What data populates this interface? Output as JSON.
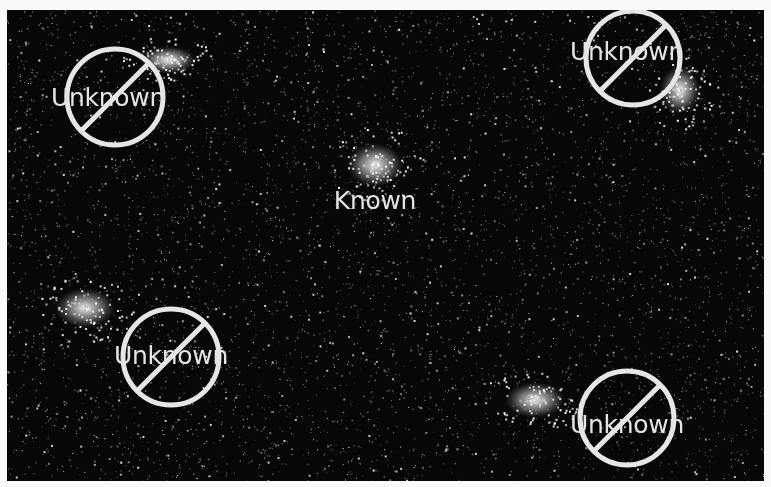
{
  "image": {
    "description": "Dark field with speckled noise and five bright diffuse clusters; one labeled Known, four labeled Unknown with prohibition signs",
    "background_color": "#070707",
    "frame_color": "#fafafa"
  },
  "clusters": [
    {
      "id": "top-left",
      "x": 168,
      "y": 60,
      "rx": 28,
      "ry": 14
    },
    {
      "id": "center",
      "x": 375,
      "y": 165,
      "rx": 28,
      "ry": 22
    },
    {
      "id": "top-right",
      "x": 680,
      "y": 90,
      "rx": 20,
      "ry": 24
    },
    {
      "id": "left",
      "x": 85,
      "y": 308,
      "rx": 30,
      "ry": 20
    },
    {
      "id": "bottom-right",
      "x": 535,
      "y": 400,
      "rx": 30,
      "ry": 18
    }
  ],
  "markers": [
    {
      "id": "known-center",
      "label": "Known",
      "type": "known",
      "label_x": 375,
      "label_y": 200,
      "circle": null
    },
    {
      "id": "unknown-top-left",
      "label": "Unknown",
      "type": "unknown",
      "label_x": 108,
      "label_y": 97,
      "circle": {
        "cx": 115,
        "cy": 97,
        "r": 48
      }
    },
    {
      "id": "unknown-top-right",
      "label": "Unknown",
      "type": "unknown",
      "label_x": 627,
      "label_y": 51,
      "circle": {
        "cx": 633,
        "cy": 58,
        "r": 47
      }
    },
    {
      "id": "unknown-bottom-left",
      "label": "Unknown",
      "type": "unknown",
      "label_x": 171,
      "label_y": 355,
      "circle": {
        "cx": 171,
        "cy": 357,
        "r": 48
      }
    },
    {
      "id": "unknown-bottom-right",
      "label": "Unknown",
      "type": "unknown",
      "label_x": 627,
      "label_y": 424,
      "circle": {
        "cx": 627,
        "cy": 418,
        "r": 47
      }
    }
  ],
  "colors": {
    "overlay": "#e6e6e6",
    "label": "#e4e4e4"
  }
}
